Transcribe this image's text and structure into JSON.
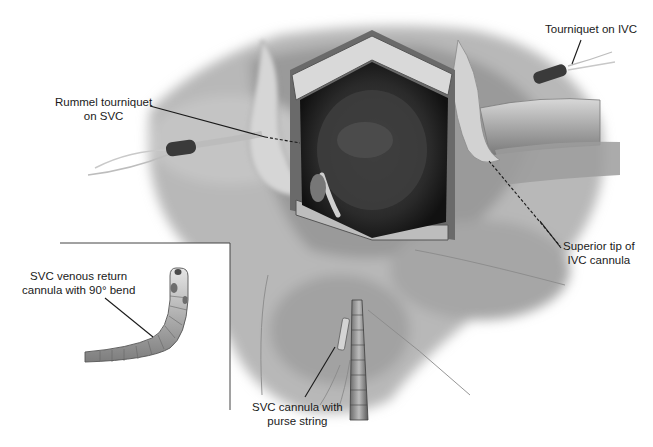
{
  "figure": {
    "type": "surgical-illustration",
    "labels": {
      "rummel_tourniquet": {
        "line1": "Rummel tourniquet",
        "line2": "on SVC"
      },
      "tourniquet_ivc": {
        "line1": "Tourniquet on IVC"
      },
      "superior_tip": {
        "line1": "Superior tip of",
        "line2": "IVC cannula"
      },
      "svc_venous_return": {
        "line1": "SVC venous return",
        "line2": "cannula with 90° bend"
      },
      "svc_cannula_purse": {
        "line1": "SVC cannula with",
        "line2": "purse string"
      }
    },
    "inset": {
      "description": "Detail of SVC venous return cannula with 90° bend"
    },
    "colors": {
      "background": "#ffffff",
      "tissue_light": "#c8c8c8",
      "tissue_mid": "#9a9a9a",
      "cavity_dark": "#2a2a2a",
      "leader_line": "#1a1a1a"
    }
  }
}
